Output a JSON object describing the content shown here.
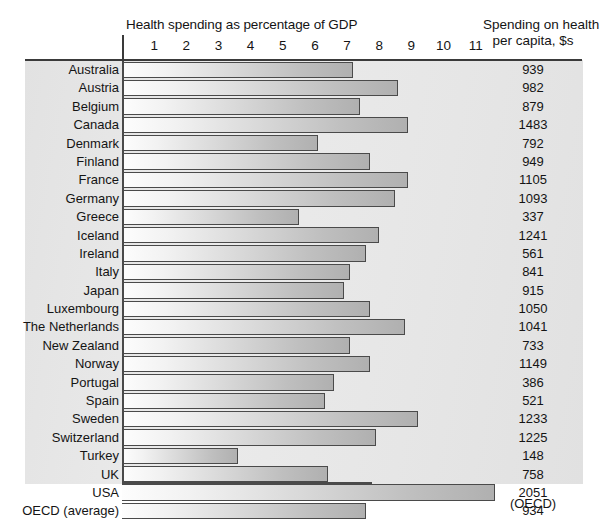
{
  "header": {
    "left_title": "Health spending as percentage of GDP",
    "right_title_line1": "Spending on health",
    "right_title_line2": "per capita, $s",
    "source": "(OECD)"
  },
  "axis": {
    "ticks": [
      "1",
      "2",
      "3",
      "4",
      "5",
      "6",
      "7",
      "8",
      "9",
      "10",
      "11"
    ]
  },
  "colors": {
    "panel_bg": "#e6e6e6",
    "bar_outline": "#4a4a4a",
    "bar_fill_start": "#fdfdfd",
    "bar_fill_end": "#b0b0b0",
    "text": "#141414"
  },
  "chart_data": {
    "type": "bar",
    "title": "Health spending as percentage of GDP",
    "xlabel": "Health spending as percentage of GDP",
    "ylabel": "",
    "xlim": [
      0,
      11.9
    ],
    "grid": false,
    "orientation": "horizontal",
    "legend": "none",
    "annotation": "(OECD)",
    "value_column_header": "Spending on health per capita, $s",
    "xticks": [
      1,
      2,
      3,
      4,
      5,
      6,
      7,
      8,
      9,
      10,
      11
    ],
    "categories": [
      "Australia",
      "Austria",
      "Belgium",
      "Canada",
      "Denmark",
      "Finland",
      "France",
      "Germany",
      "Greece",
      "Iceland",
      "Ireland",
      "Italy",
      "Japan",
      "Luxembourg",
      "The Netherlands",
      "New Zealand",
      "Norway",
      "Portugal",
      "Spain",
      "Sweden",
      "Switzerland",
      "Turkey",
      "UK",
      "USA",
      "OECD (average)"
    ],
    "values": [
      7.2,
      8.6,
      7.4,
      8.9,
      6.1,
      7.7,
      8.9,
      8.5,
      5.5,
      8.0,
      7.6,
      7.1,
      6.9,
      7.7,
      8.8,
      7.1,
      7.7,
      6.6,
      6.3,
      9.2,
      7.9,
      3.6,
      6.4,
      11.6,
      7.6
    ],
    "per_capita": [
      "939",
      "982",
      "879",
      "1483",
      "792",
      "949",
      "1105",
      "1093",
      "337",
      "1241",
      "561",
      "841",
      "915",
      "1050",
      "1041",
      "733",
      "1149",
      "386",
      "521",
      "1233",
      "1225",
      "148",
      "758",
      "2051",
      "934"
    ]
  }
}
